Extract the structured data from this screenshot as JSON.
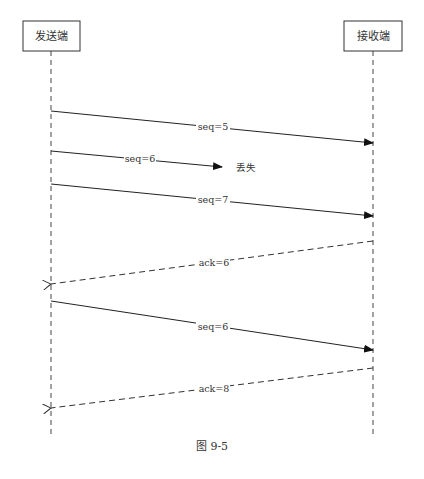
{
  "diagram": {
    "type": "sequence",
    "actors": [
      {
        "id": "sender",
        "label": "发送端",
        "x": 51
      },
      {
        "id": "receiver",
        "label": "接收端",
        "x": 373
      }
    ],
    "messages": [
      {
        "from": "sender",
        "to": "receiver",
        "label": "seq=5",
        "style": "solid",
        "y1": 111,
        "y2": 143
      },
      {
        "from": "sender",
        "to": "lost",
        "label": "seq=6",
        "style": "solid",
        "y1": 151,
        "y2": 167,
        "note": "丢失"
      },
      {
        "from": "sender",
        "to": "receiver",
        "label": "seq=7",
        "style": "solid",
        "y1": 184,
        "y2": 216
      },
      {
        "from": "receiver",
        "to": "sender",
        "label": "ack=6",
        "style": "dashed",
        "y1": 241,
        "y2": 284
      },
      {
        "from": "sender",
        "to": "receiver",
        "label": "seq=6",
        "style": "solid",
        "y1": 301,
        "y2": 350
      },
      {
        "from": "receiver",
        "to": "sender",
        "label": "ack=8",
        "style": "dashed",
        "y1": 368,
        "y2": 408
      }
    ],
    "caption": "图 9-5"
  }
}
